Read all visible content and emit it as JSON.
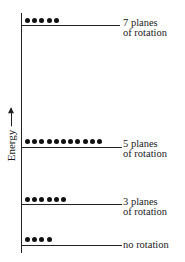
{
  "axis": {
    "label": "Energy",
    "arrow": "up-arrow"
  },
  "levels": [
    {
      "id": "7-planes",
      "line1": "7 planes",
      "line2": "of rotation",
      "dots": 5,
      "y": 25
    },
    {
      "id": "5-planes",
      "line1": "5 planes",
      "line2": "of rotation",
      "dots": 11,
      "y": 147
    },
    {
      "id": "3-planes",
      "line1": "3 planes",
      "line2": "of rotation",
      "dots": 6,
      "y": 204
    },
    {
      "id": "no-rotation",
      "line1": "no rotation",
      "line2": "",
      "dots": 4,
      "y": 245
    }
  ]
}
